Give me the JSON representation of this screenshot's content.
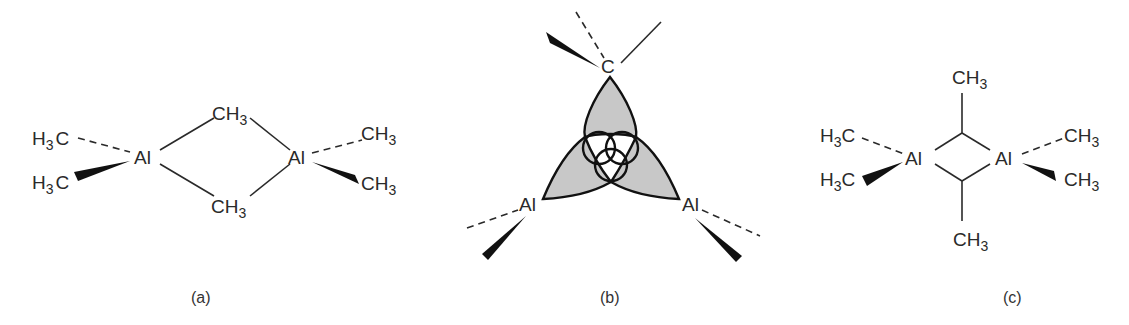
{
  "figure": {
    "panels": [
      {
        "id": "a",
        "caption": "(a)",
        "atoms": {
          "al_left": "Al",
          "al_right": "Al",
          "bridge_top": {
            "main": "CH",
            "sub": "3"
          },
          "bridge_bottom": {
            "main": "CH",
            "sub": "3"
          },
          "term_left_top": {
            "pre": "H",
            "sub": "3",
            "post": "C"
          },
          "term_left_bottom": {
            "pre": "H",
            "sub": "3",
            "post": "C"
          },
          "term_right_top": {
            "main": "CH",
            "sub": "3"
          },
          "term_right_bottom": {
            "main": "CH",
            "sub": "3"
          }
        }
      },
      {
        "id": "b",
        "caption": "(b)",
        "atoms": {
          "carbon": "C",
          "al_left": "Al",
          "al_right": "Al"
        }
      },
      {
        "id": "c",
        "caption": "(c)",
        "atoms": {
          "al_left": "Al",
          "al_right": "Al",
          "bridge_top": {
            "main": "CH",
            "sub": "3"
          },
          "bridge_bottom": {
            "main": "CH",
            "sub": "3"
          },
          "term_left_top": {
            "pre": "H",
            "sub": "3",
            "post": "C"
          },
          "term_left_bottom": {
            "pre": "H",
            "sub": "3",
            "post": "C"
          },
          "term_right_top": {
            "main": "CH",
            "sub": "3"
          },
          "term_right_bottom": {
            "main": "CH",
            "sub": "3"
          }
        }
      }
    ],
    "colors": {
      "ink": "#2a2a2a",
      "orbital_fill": "#c8c8c8",
      "orbital_outline": "#111111"
    }
  }
}
